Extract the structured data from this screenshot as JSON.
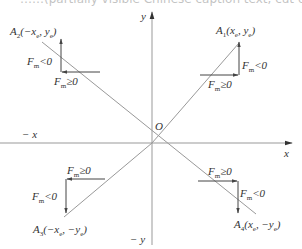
{
  "header_cut_text": "……(partially visible Chinese caption text, cut off at top)……",
  "axes": {
    "x_pos": "x",
    "x_neg": "− x",
    "y_pos": "y",
    "y_neg": "− y",
    "origin": "O"
  },
  "quadrants": [
    {
      "id": "A1",
      "point_label": "A",
      "sub": "1",
      "coords": "(x",
      "coords_sub1": "e",
      "coords_mid": ", y",
      "coords_sub2": "e",
      "coords_end": ")",
      "fm_neg": "F",
      "fm_neg_sub": "m",
      "fm_neg_rel": "<0",
      "fm_pos": "F",
      "fm_pos_sub": "m",
      "fm_pos_rel": "≥0"
    },
    {
      "id": "A2",
      "point_label": "A",
      "sub": "2",
      "coords": "(−x",
      "coords_sub1": "e",
      "coords_mid": ", y",
      "coords_sub2": "e",
      "coords_end": ")",
      "fm_neg": "F",
      "fm_neg_sub": "m",
      "fm_neg_rel": "<0",
      "fm_pos": "F",
      "fm_pos_sub": "m",
      "fm_pos_rel": "≥0"
    },
    {
      "id": "A3",
      "point_label": "A",
      "sub": "3",
      "coords": "(−x",
      "coords_sub1": "e",
      "coords_mid": ", −y",
      "coords_sub2": "e",
      "coords_end": ")",
      "fm_neg": "F",
      "fm_neg_sub": "m",
      "fm_neg_rel": "<0",
      "fm_pos": "F",
      "fm_pos_sub": "m",
      "fm_pos_rel": "≥0"
    },
    {
      "id": "A4",
      "point_label": "A",
      "sub": "4",
      "coords": "(x",
      "coords_sub1": "e",
      "coords_mid": ", −y",
      "coords_sub2": "e",
      "coords_end": ")",
      "fm_neg": "F",
      "fm_neg_sub": "m",
      "fm_neg_rel": "<0",
      "fm_pos": "F",
      "fm_pos_sub": "m",
      "fm_pos_rel": "≥0"
    }
  ],
  "colors": {
    "line": "#888888",
    "arrow": "#444444",
    "text": "#333333"
  }
}
